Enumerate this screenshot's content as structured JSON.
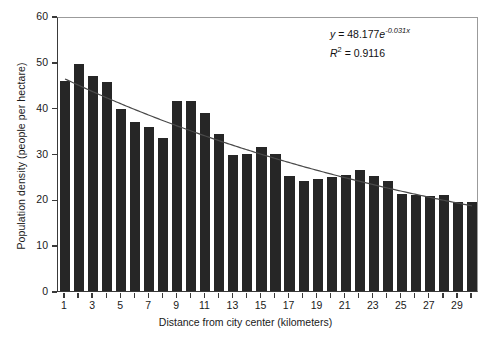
{
  "chart_data": {
    "type": "bar",
    "title": "",
    "xlabel": "Distance from city center (kilometers)",
    "ylabel": "Population density (people per hectare)",
    "xlim": [
      0.5,
      30.5
    ],
    "ylim": [
      0,
      60
    ],
    "yticks": [
      0,
      10,
      20,
      30,
      40,
      50,
      60
    ],
    "xticks": [
      1,
      3,
      5,
      7,
      9,
      11,
      13,
      15,
      17,
      19,
      21,
      23,
      25,
      27,
      29
    ],
    "grid": false,
    "legend": "none",
    "bar_color": "#262626",
    "trend_color": "#4a4a4a",
    "categories": [
      1,
      2,
      3,
      4,
      5,
      6,
      7,
      8,
      9,
      10,
      11,
      12,
      13,
      14,
      15,
      16,
      17,
      18,
      19,
      20,
      21,
      22,
      23,
      24,
      25,
      26,
      27,
      28,
      29,
      30
    ],
    "values": [
      45.8,
      49.5,
      47.0,
      45.7,
      39.8,
      36.8,
      35.7,
      33.4,
      41.4,
      41.4,
      38.8,
      34.3,
      29.7,
      30.0,
      31.5,
      30.0,
      25.2,
      24.0,
      24.4,
      24.8,
      25.4,
      26.3,
      25.1,
      24.1,
      21.2,
      21.0,
      20.7,
      21.0,
      19.5,
      19.4
    ],
    "series": [
      {
        "name": "Population density",
        "values": [
          45.8,
          49.5,
          47.0,
          45.7,
          39.8,
          36.8,
          35.7,
          33.4,
          41.4,
          41.4,
          38.8,
          34.3,
          29.7,
          30.0,
          31.5,
          30.0,
          25.2,
          24.0,
          24.4,
          24.8,
          25.4,
          26.3,
          25.1,
          24.1,
          21.2,
          21.0,
          20.7,
          21.0,
          19.5,
          19.4
        ]
      }
    ],
    "trendline": {
      "type": "exponential",
      "equation_y": "y = 48.177e",
      "equation_exponent": "-0.031x",
      "coefficient": 48.177,
      "exponent_rate": -0.031,
      "r_squared_label": "R",
      "r_squared_sup": "2",
      "r_squared_value": " = 0.9116",
      "r_squared": 0.9116
    }
  },
  "annotation": {
    "line1_prefix": "y",
    "line1_mid": " = 48.177",
    "line1_e": "e",
    "line1_exp": "-0.031x",
    "line2_r": "R",
    "line2_sup": "2",
    "line2_rest": " = 0.9116"
  }
}
